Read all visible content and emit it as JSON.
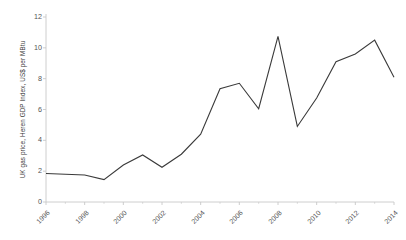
{
  "chart_data": {
    "type": "line",
    "title": "",
    "subtitle": "",
    "xlabel": "",
    "ylabel": "UK gas price, Heren GDP Index, US$ per MBtu",
    "xlim": [
      1996,
      2014
    ],
    "ylim": [
      0,
      12
    ],
    "grid": false,
    "legend": false,
    "legend_position": "none",
    "line_color": "#3a3a3a",
    "axis_color": "#c8c8c8",
    "x": [
      1996,
      1997,
      1998,
      1999,
      2000,
      2001,
      2002,
      2003,
      2004,
      2005,
      2006,
      2007,
      2008,
      2009,
      2010,
      2011,
      2012,
      2013,
      2014
    ],
    "values": [
      1.85,
      1.8,
      1.75,
      1.45,
      2.4,
      3.05,
      2.25,
      3.1,
      4.4,
      7.35,
      7.7,
      6.05,
      10.75,
      4.9,
      6.75,
      9.1,
      9.6,
      10.5,
      8.1
    ],
    "y_ticks": [
      0,
      2,
      4,
      6,
      8,
      10,
      12
    ],
    "y_tick_labels": [
      "0",
      "2",
      "4",
      "6",
      "8",
      "10",
      "12"
    ],
    "x_ticks": [
      1996,
      1998,
      2000,
      2002,
      2004,
      2006,
      2008,
      2010,
      2012,
      2014
    ],
    "x_tick_labels": [
      "1996",
      "1998",
      "2000",
      "2002",
      "2004",
      "2006",
      "2008",
      "2010",
      "2012",
      "2014"
    ],
    "x_minor_ticks": [
      1997,
      1999,
      2001,
      2003,
      2005,
      2007,
      2009,
      2011,
      2013
    ],
    "series": [
      {
        "name": "UK gas price",
        "values": [
          1.85,
          1.8,
          1.75,
          1.45,
          2.4,
          3.05,
          2.25,
          3.1,
          4.4,
          7.35,
          7.7,
          6.05,
          10.75,
          4.9,
          6.75,
          9.1,
          9.6,
          10.5,
          8.1
        ]
      }
    ]
  }
}
